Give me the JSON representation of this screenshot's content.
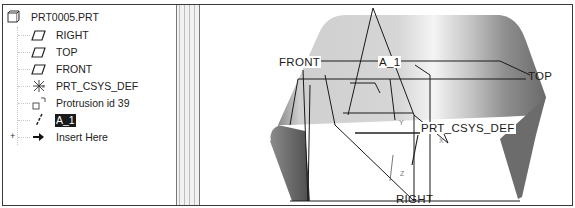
{
  "model_tree": {
    "root": {
      "label": "PRT0005.PRT",
      "icon": "part-icon"
    },
    "items": [
      {
        "label": "RIGHT",
        "icon": "datum-plane-icon",
        "selected": false
      },
      {
        "label": "TOP",
        "icon": "datum-plane-icon",
        "selected": false
      },
      {
        "label": "FRONT",
        "icon": "datum-plane-icon",
        "selected": false
      },
      {
        "label": "PRT_CSYS_DEF",
        "icon": "coordinate-system-icon",
        "selected": false
      },
      {
        "label": "Protrusion id 39",
        "icon": "protrusion-icon",
        "selected": false,
        "expander": "+"
      },
      {
        "label": "A_1",
        "icon": "datum-axis-icon",
        "selected": true
      },
      {
        "label": "Insert Here",
        "icon": "insert-arrow-icon",
        "selected": false
      }
    ]
  },
  "viewport": {
    "labels": {
      "front": "FRONT",
      "axis": "A_1",
      "top": "TOP",
      "csys": "PRT_CSYS_DEF",
      "right": "RIGHT",
      "y_axis": "Y",
      "x_axis": "X",
      "z_axis": "Z"
    },
    "colors": {
      "surface_light": "#d8d8d8",
      "surface_dark": "#6e6e6e",
      "datum_lines": "#1a1a1a"
    }
  }
}
